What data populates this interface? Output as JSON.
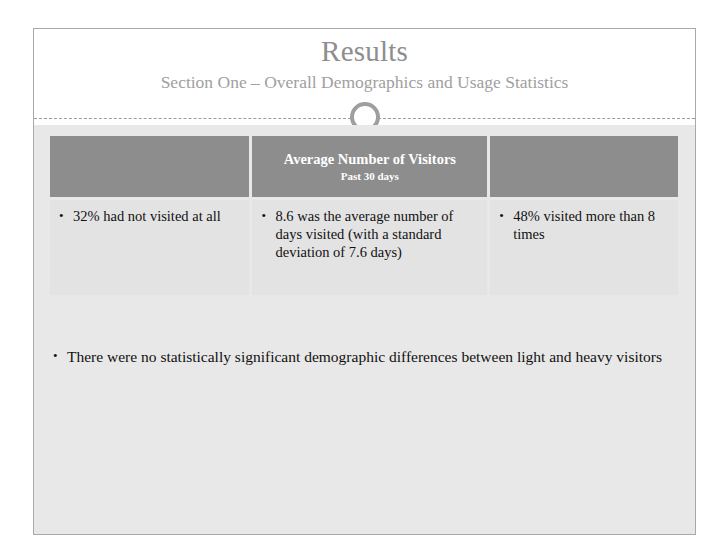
{
  "slide": {
    "title": "Results",
    "subtitle": "Section One – Overall Demographics and Usage Statistics",
    "ornament": "circle-ring-ornament",
    "colors": {
      "title_text": "#8e8e8e",
      "subtitle_text": "#a0a0a0",
      "table_header_bg": "#8d8d8d",
      "table_cell_bg": "#e3e3e3",
      "body_bg": "#e8e8e8",
      "footer_band": "#b4b4b4",
      "slide_border": "#a9a9a9"
    }
  },
  "table": {
    "headers": [
      {
        "title": "",
        "subtitle": ""
      },
      {
        "title": "Average Number of Visitors",
        "subtitle": "Past 30 days"
      },
      {
        "title": "",
        "subtitle": ""
      }
    ],
    "rows": [
      {
        "cells": [
          {
            "bullets": [
              "32% had not visited at all"
            ]
          },
          {
            "bullets": [
              "8.6 was the average number of days visited (with a standard deviation of 7.6 days)"
            ]
          },
          {
            "bullets": [
              "48% visited more than 8 times"
            ]
          }
        ]
      }
    ]
  },
  "body": {
    "bullets": [
      "There were no statistically significant demographic differences between light and heavy visitors"
    ]
  },
  "bullet_glyph": "•"
}
